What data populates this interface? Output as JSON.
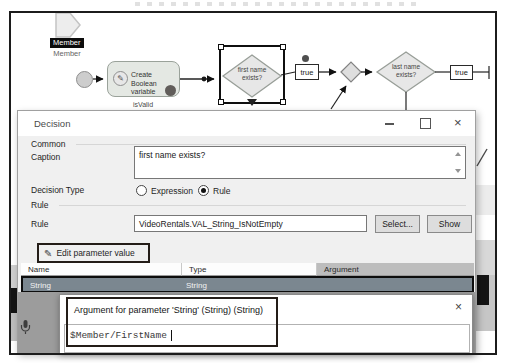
{
  "flowchart": {
    "member": {
      "label": "Member",
      "sublabel": "Member"
    },
    "create_node": {
      "label": "Create Boolean variable",
      "sublabel": "isValid"
    },
    "decision1": {
      "lines": [
        "first name",
        "exists?"
      ]
    },
    "edge1_label": "true",
    "decision2": {
      "lines": [
        "last name",
        "exists?"
      ]
    },
    "edge2_label": "true"
  },
  "dialog": {
    "title": "Decision",
    "common_group": "Common",
    "caption_label": "Caption",
    "caption_value": "first name exists?",
    "decision_type_label": "Decision Type",
    "options": [
      {
        "label": "Expression"
      },
      {
        "label": "Rule"
      }
    ],
    "rule_group": "Rule",
    "rule_label": "Rule",
    "rule_value": "VideoRentals.VAL_String_IsNotEmpty",
    "select_button": "Select...",
    "show_button": "Show",
    "edit_param_button": "Edit parameter value",
    "table": {
      "headers": [
        "Name",
        "Type",
        "Argument"
      ],
      "row": {
        "name": "String",
        "type": "String",
        "argument": ""
      }
    }
  },
  "popup": {
    "title": "Argument for parameter 'String' (String) (String)",
    "value": "$Member/FirstName"
  },
  "icons": {
    "close": "×",
    "pencil": "✎"
  },
  "colors": {
    "annotation": "#241d18",
    "selected_row": "#7b8790",
    "dim_overlay": "#9c9c9c"
  }
}
